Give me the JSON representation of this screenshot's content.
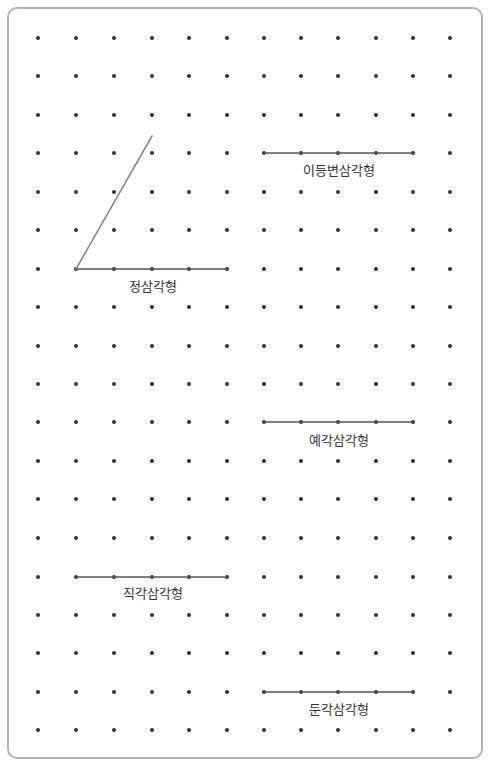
{
  "board": {
    "grid": {
      "columns_x": [
        38,
        76,
        114,
        152,
        189,
        227,
        264,
        301,
        338,
        376,
        413,
        450
      ],
      "rows_y": [
        38,
        76,
        115,
        153,
        192,
        230,
        269,
        307,
        346,
        384,
        422,
        461,
        499,
        538,
        577,
        615,
        653,
        692,
        730
      ],
      "dot_color": "#333333",
      "dot_radius": 2
    },
    "segments": [
      {
        "name": "equilateral-base",
        "x1": 76,
        "y1": 269,
        "x2": 227,
        "y2": 269,
        "color": "#555555",
        "width": 1.6
      },
      {
        "name": "equilateral-side",
        "x1": 76,
        "y1": 269,
        "x2": 152,
        "y2": 136,
        "color": "#8a8a8a",
        "width": 1.6
      },
      {
        "name": "isosceles-base",
        "x1": 264,
        "y1": 153,
        "x2": 413,
        "y2": 153,
        "color": "#555555",
        "width": 1.6
      },
      {
        "name": "acute-base",
        "x1": 264,
        "y1": 422,
        "x2": 413,
        "y2": 422,
        "color": "#555555",
        "width": 1.6
      },
      {
        "name": "right-base",
        "x1": 76,
        "y1": 577,
        "x2": 227,
        "y2": 577,
        "color": "#555555",
        "width": 1.6
      },
      {
        "name": "obtuse-base",
        "x1": 264,
        "y1": 692,
        "x2": 413,
        "y2": 692,
        "color": "#555555",
        "width": 1.6
      }
    ],
    "labels": {
      "equilateral": {
        "text": "정삼각형",
        "x": 153,
        "y": 285
      },
      "isosceles": {
        "text": "이등변삼각형",
        "x": 339,
        "y": 169
      },
      "acute": {
        "text": "예각삼각형",
        "x": 339,
        "y": 439
      },
      "right": {
        "text": "직각삼각형",
        "x": 153,
        "y": 592
      },
      "obtuse": {
        "text": "둔각삼각형",
        "x": 339,
        "y": 708
      }
    }
  }
}
